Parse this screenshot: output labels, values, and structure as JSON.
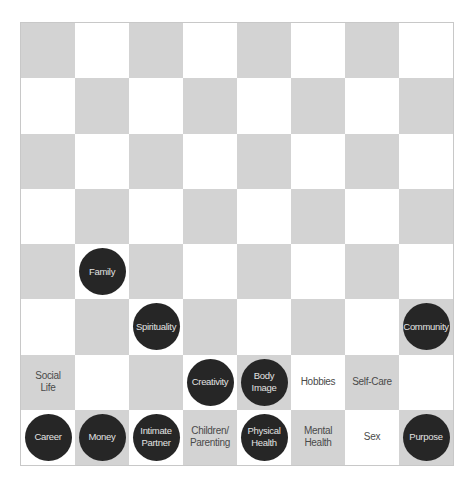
{
  "board": {
    "rows": 8,
    "cols": 8,
    "colors": {
      "dark_square": "#d3d3d3",
      "light_square": "#ffffff",
      "piece": "#262626",
      "piece_text": "#e2e2e2",
      "label_text": "#4a4a4a"
    },
    "pieces": [
      {
        "row": 4,
        "col": 1,
        "label": "Family"
      },
      {
        "row": 5,
        "col": 2,
        "label": "Spirituality"
      },
      {
        "row": 5,
        "col": 7,
        "label": "Community"
      },
      {
        "row": 6,
        "col": 3,
        "label": "Creativity"
      },
      {
        "row": 6,
        "col": 4,
        "label": "Body\nImage"
      },
      {
        "row": 7,
        "col": 0,
        "label": "Career"
      },
      {
        "row": 7,
        "col": 1,
        "label": "Money"
      },
      {
        "row": 7,
        "col": 2,
        "label": "Intimate\nPartner"
      },
      {
        "row": 7,
        "col": 4,
        "label": "Physical\nHealth"
      },
      {
        "row": 7,
        "col": 7,
        "label": "Purpose"
      }
    ],
    "square_labels": [
      {
        "row": 6,
        "col": 0,
        "label": "Social\nLife"
      },
      {
        "row": 6,
        "col": 5,
        "label": "Hobbies"
      },
      {
        "row": 6,
        "col": 6,
        "label": "Self-Care"
      },
      {
        "row": 7,
        "col": 3,
        "label": "Children/\nParenting"
      },
      {
        "row": 7,
        "col": 5,
        "label": "Mental\nHealth"
      },
      {
        "row": 7,
        "col": 6,
        "label": "Sex"
      }
    ]
  }
}
